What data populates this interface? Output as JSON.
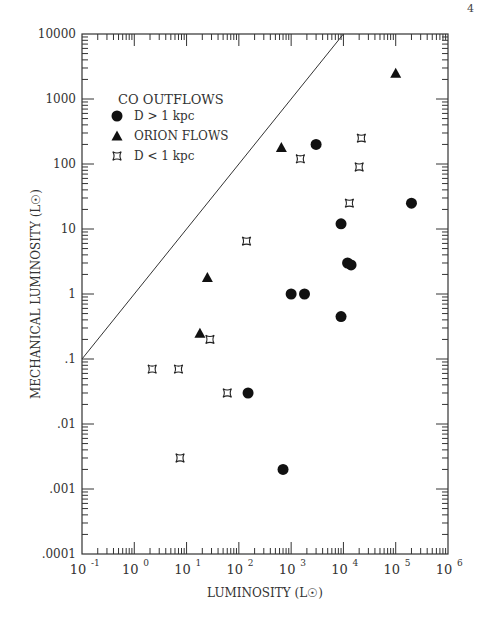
{
  "page": {
    "number": "4"
  },
  "chart_data": {
    "type": "scatter",
    "title": "",
    "xlabel": "LUMINOSITY (L☉)",
    "ylabel": "MECHANICAL LUMINOSITY (L☉)",
    "xscale": "log",
    "yscale": "log",
    "xlim": [
      0.1,
      1000000
    ],
    "ylim": [
      0.0001,
      10000
    ],
    "x_ticks": [
      "10^-1",
      "10^0",
      "10^1",
      "10^2",
      "10^3",
      "10^4",
      "10^5",
      "10^6"
    ],
    "y_ticks": [
      "10000",
      "1000",
      "100",
      "10",
      "1",
      ".1",
      ".01",
      ".001",
      ".0001"
    ],
    "grid": false,
    "legend": {
      "title": "CO OUTFLOWS",
      "position": "upper-left",
      "entries": [
        {
          "label": "D > 1 kpc",
          "marker": "circle"
        },
        {
          "label": "ORION FLOWS",
          "marker": "triangle"
        },
        {
          "label": "D < 1 kpc",
          "marker": "star"
        }
      ]
    },
    "reference_line": {
      "from": [
        0.1,
        0.1
      ],
      "to": [
        1000000,
        100000000
      ],
      "note": "L_mech = L, clipped at plot top near L≈9000"
    },
    "series": [
      {
        "name": "D > 1 kpc",
        "marker": "circle",
        "points": [
          [
            3000,
            200
          ],
          [
            9000,
            12
          ],
          [
            12000,
            3
          ],
          [
            14000,
            2.8
          ],
          [
            9000,
            0.45
          ],
          [
            1000,
            1
          ],
          [
            1800,
            1
          ],
          [
            200000,
            25
          ],
          [
            150,
            0.03
          ],
          [
            700,
            0.002
          ]
        ]
      },
      {
        "name": "ORION FLOWS",
        "marker": "triangle",
        "points": [
          [
            650,
            180
          ],
          [
            100000,
            2500
          ],
          [
            25,
            1.8
          ],
          [
            18,
            0.25
          ]
        ]
      },
      {
        "name": "D < 1 kpc",
        "marker": "star",
        "points": [
          [
            1500,
            120
          ],
          [
            22000,
            250
          ],
          [
            20000,
            90
          ],
          [
            13000,
            25
          ],
          [
            140,
            6.5
          ],
          [
            28,
            0.2
          ],
          [
            2.2,
            0.07
          ],
          [
            7,
            0.07
          ],
          [
            60,
            0.03
          ],
          [
            7.5,
            0.003
          ]
        ]
      }
    ]
  }
}
